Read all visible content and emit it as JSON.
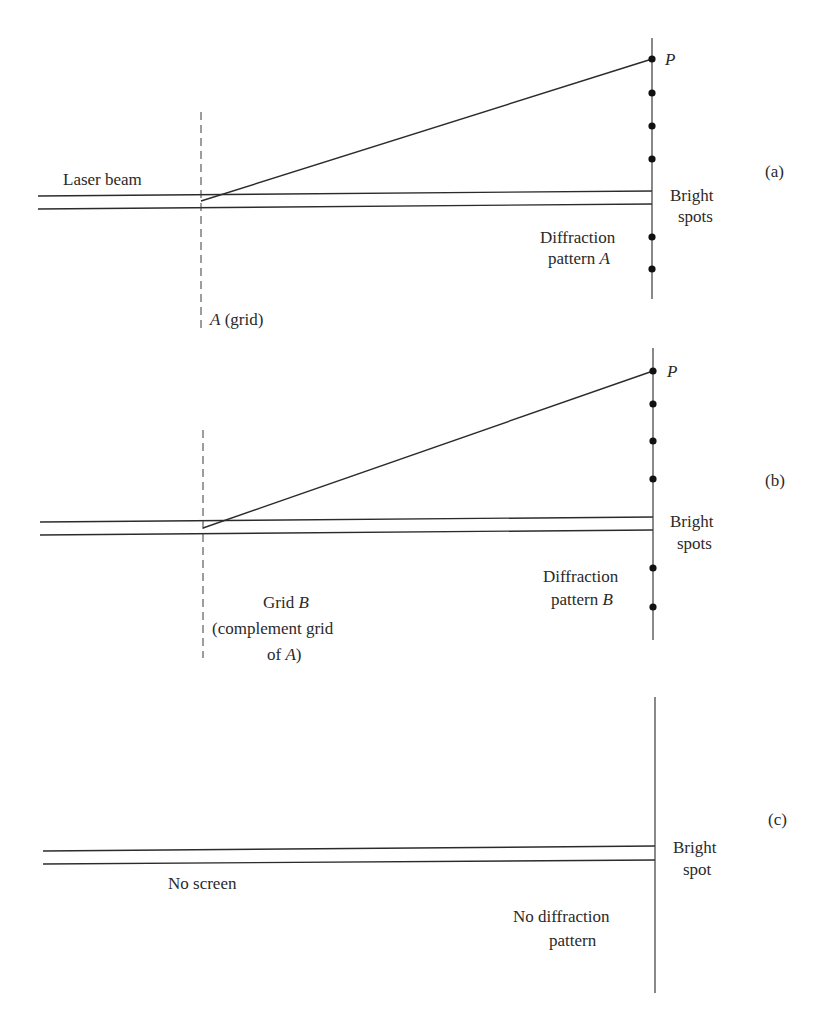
{
  "figure": {
    "panels": [
      {
        "id": "a",
        "panel_label": "(a)",
        "beam_label": "Laser beam",
        "grid_label_italic": "A",
        "grid_label_rest": " (grid)",
        "point_label": "P",
        "bright_label_1": "Bright",
        "bright_label_2": "spots",
        "pattern_label_1": "Diffraction",
        "pattern_label_2": "pattern ",
        "pattern_label_italic": "A",
        "spots_above_beam": 4,
        "spots_below_beam": 2
      },
      {
        "id": "b",
        "panel_label": "(b)",
        "grid_label_1": "Grid ",
        "grid_label_1_italic": "B",
        "grid_label_2": "(complement grid",
        "grid_label_3": "of ",
        "grid_label_3_italic": "A",
        "grid_label_3_end": ")",
        "point_label": "P",
        "bright_label_1": "Bright",
        "bright_label_2": "spots",
        "pattern_label_1": "Diffraction",
        "pattern_label_2": "pattern ",
        "pattern_label_italic": "B",
        "spots_above_beam": 4,
        "spots_below_beam": 2
      },
      {
        "id": "c",
        "panel_label": "(c)",
        "screen_label": "No screen",
        "bright_label_1": "Bright",
        "bright_label_2": "spot",
        "pattern_label_1": "No diffraction",
        "pattern_label_2": "pattern"
      }
    ]
  }
}
